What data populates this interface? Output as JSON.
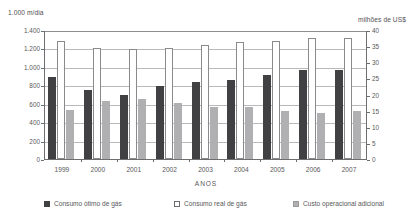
{
  "chart_data": {
    "type": "bar",
    "title": "",
    "xlabel": "ANOS",
    "ylabel": "1.000 m/dia",
    "ylabel_right": "milhões de US$",
    "categories": [
      "1999",
      "2000",
      "2001",
      "2002",
      "2003",
      "2004",
      "2005",
      "2006",
      "2007"
    ],
    "ylim": [
      0,
      1400
    ],
    "ylim_right": [
      0,
      40
    ],
    "yticks": [
      "0",
      "200",
      "400",
      "600",
      "800",
      "1.000",
      "1.200",
      "1.400"
    ],
    "yticks_right": [
      "0",
      "5",
      "10",
      "15",
      "20",
      "25",
      "30",
      "35",
      "40"
    ],
    "grid": true,
    "legend_position": "bottom",
    "series": [
      {
        "name": "Consumo ótimo de gás",
        "axis": "left",
        "color": "#414042",
        "values": [
          890,
          750,
          700,
          790,
          840,
          860,
          915,
          965,
          965
        ]
      },
      {
        "name": "Consumo real de gás",
        "axis": "right",
        "color": "#ffffff",
        "values": [
          36.5,
          34.5,
          34.0,
          34.5,
          35.3,
          36.3,
          36.7,
          37.5,
          37.5
        ]
      },
      {
        "name": "Custo operacional adicional",
        "axis": "right",
        "color": "#b0b0b2",
        "values": [
          15.3,
          18.0,
          18.6,
          17.5,
          16.2,
          16.2,
          15.0,
          14.3,
          14.8
        ]
      }
    ]
  }
}
